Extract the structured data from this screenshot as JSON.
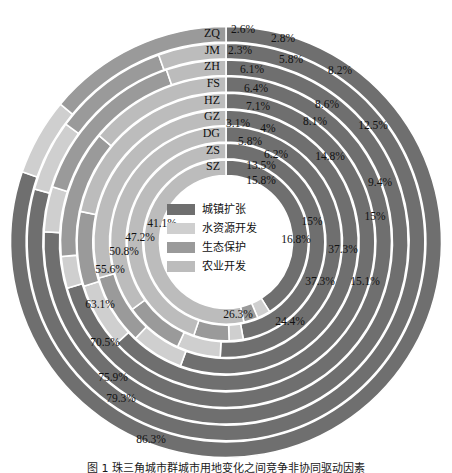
{
  "legend": {
    "items": [
      {
        "label": "城镇扩张",
        "color": "#6f6f6f"
      },
      {
        "label": "水资源开发",
        "color": "#cfcfcf"
      },
      {
        "label": "生态保护",
        "color": "#9a9a9a"
      },
      {
        "label": "农业开发",
        "color": "#bcbcbc"
      }
    ]
  },
  "caption": {
    "text": "图 1  珠三角城市群城市用地变化之间竞争非协同驱动因素"
  },
  "chart_data": {
    "type": "pie",
    "title": "",
    "subtype": "nested-donut (sunburst-style concentric rings)",
    "legend_position": "center",
    "grid": false,
    "categories": [
      "城镇扩张",
      "水资源开发",
      "生态保护",
      "农业开发"
    ],
    "category_colors": [
      "#6f6f6f",
      "#cfcfcf",
      "#9a9a9a",
      "#bcbcbc"
    ],
    "ring_order_inner_to_outer": [
      "SZ",
      "ZS",
      "DG",
      "GZ",
      "HZ",
      "FS",
      "ZH",
      "JM",
      "ZQ"
    ],
    "rings": [
      {
        "name": "SZ",
        "ring_index": 0,
        "values": [
          41.1,
          2.6,
          2.8,
          53.5
        ],
        "labels_shown": [
          "41.1%",
          "2.6%",
          "2.8%",
          ""
        ]
      },
      {
        "name": "ZS",
        "ring_index": 1,
        "values": [
          47.2,
          2.3,
          5.8,
          44.7
        ],
        "labels_shown": [
          "47.2%",
          "2.3%",
          "5.8%",
          ""
        ]
      },
      {
        "name": "DG",
        "ring_index": 2,
        "values": [
          50.8,
          6.1,
          8.2,
          34.9
        ],
        "labels_shown": [
          "50.8%",
          "6.1%",
          "8.2%",
          ""
        ]
      },
      {
        "name": "GZ",
        "ring_index": 3,
        "values": [
          55.6,
          6.4,
          8.6,
          29.4
        ],
        "labels_shown": [
          "55.6%",
          "6.4%",
          "8.6%",
          ""
        ]
      },
      {
        "name": "HZ",
        "ring_index": 4,
        "values": [
          63.1,
          7.1,
          8.1,
          21.7
        ],
        "labels_shown": [
          "63.1%",
          "7.1%",
          "8.1%",
          ""
        ]
      },
      {
        "name": "FS",
        "ring_index": 5,
        "values": [
          70.5,
          3.1,
          12.5,
          13.9
        ],
        "labels_shown": [
          "70.5%",
          "3.1%",
          "12.5%",
          ""
        ]
      },
      {
        "name": "ZH",
        "ring_index": 6,
        "values": [
          75.9,
          4.0,
          14.8,
          5.3
        ],
        "labels_shown": [
          "75.9%",
          "4%",
          "14.8%",
          ""
        ]
      },
      {
        "name": "JM",
        "ring_index": 7,
        "values": [
          79.3,
          5.8,
          9.4,
          5.5
        ],
        "labels_shown": [
          "79.3%",
          "5.8%",
          "9.4%",
          ""
        ]
      },
      {
        "name": "ZQ",
        "ring_index": 8,
        "values": [
          86.3,
          6.2,
          15.0,
          0.0
        ],
        "labels_shown": [
          "86.3%",
          "6.2%",
          "15%",
          ""
        ]
      }
    ],
    "extra_labels": [
      "13.5%",
      "15.8%",
      "15%",
      "16.8%",
      "37.3%",
      "37.3%",
      "15.1%",
      "26.3%",
      "24.4%"
    ],
    "all_percent_labels": [
      "2.6%",
      "2.8%",
      "2.3%",
      "5.8%",
      "6.1%",
      "8.2%",
      "6.4%",
      "8.6%",
      "7.1%",
      "8.1%",
      "3.1%",
      "12.5%",
      "4%",
      "14.8%",
      "5.8%",
      "6.2%",
      "9.4%",
      "13.5%",
      "15.8%",
      "15%",
      "15%",
      "16.8%",
      "37.3%",
      "37.3%",
      "15.1%",
      "26.3%",
      "24.4%",
      "41.1%",
      "47.2%",
      "50.8%",
      "55.6%",
      "63.1%",
      "70.5%",
      "75.9%",
      "79.3%",
      "86.3%"
    ],
    "city_labels": [
      "SZ",
      "ZS",
      "DG",
      "GZ",
      "HZ",
      "FS",
      "ZH",
      "JM",
      "ZQ"
    ]
  }
}
